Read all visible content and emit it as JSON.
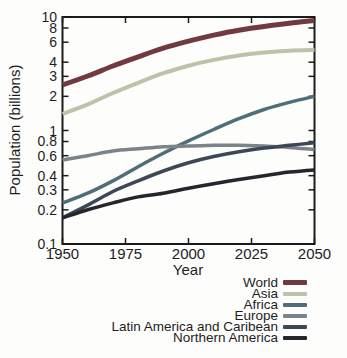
{
  "chart_data": {
    "type": "line",
    "title": "",
    "xlabel": "Year",
    "ylabel": "Population (billions)",
    "x_scale": "linear",
    "y_scale": "log",
    "xlim": [
      1950,
      2050
    ],
    "ylim": [
      0.1,
      10
    ],
    "grid": false,
    "legend_position": "below-right",
    "axis_color": "#1b1b1b",
    "x_tick_labels": [
      "1950",
      "1975",
      "2000",
      "2025",
      "2050"
    ],
    "y_tick_labels": [
      "10",
      "8",
      "6",
      "4",
      "3",
      "2",
      "1",
      "0.8",
      "0.6",
      "0.4",
      "0.3",
      "0.2",
      "0.1"
    ],
    "x": [
      1950,
      1960,
      1970,
      1980,
      1990,
      2000,
      2010,
      2020,
      2030,
      2040,
      2050
    ],
    "series": [
      {
        "name": "World",
        "color": "#713a3e",
        "line_width": 5,
        "values": [
          2.52,
          3.02,
          3.7,
          4.45,
          5.31,
          6.12,
          6.92,
          7.65,
          8.25,
          8.8,
          9.3
        ]
      },
      {
        "name": "Asia",
        "color": "#bcc3ab",
        "line_width": 4,
        "values": [
          1.4,
          1.7,
          2.14,
          2.63,
          3.2,
          3.72,
          4.19,
          4.58,
          4.87,
          5.05,
          5.13
        ]
      },
      {
        "name": "Africa",
        "color": "#4e6f77",
        "line_width": 3.5,
        "values": [
          0.23,
          0.28,
          0.36,
          0.48,
          0.63,
          0.81,
          1.02,
          1.27,
          1.53,
          1.77,
          2.0
        ]
      },
      {
        "name": "Europe",
        "color": "#7d8489",
        "line_width": 3.5,
        "values": [
          0.55,
          0.6,
          0.66,
          0.69,
          0.72,
          0.73,
          0.74,
          0.74,
          0.73,
          0.71,
          0.68
        ]
      },
      {
        "name": "Latin America and Caribean",
        "color": "#3d4857",
        "line_width": 3.5,
        "values": [
          0.17,
          0.22,
          0.29,
          0.36,
          0.44,
          0.52,
          0.59,
          0.65,
          0.7,
          0.74,
          0.78
        ]
      },
      {
        "name": "Northern America",
        "color": "#25262b",
        "line_width": 3.5,
        "values": [
          0.17,
          0.2,
          0.23,
          0.26,
          0.28,
          0.31,
          0.34,
          0.37,
          0.4,
          0.43,
          0.45
        ]
      }
    ]
  }
}
